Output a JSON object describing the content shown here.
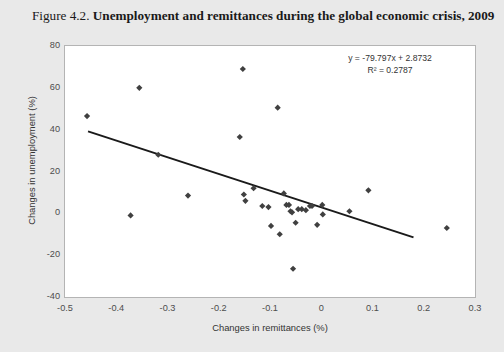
{
  "figure": {
    "number": "Figure 4.2.",
    "caption": "Unemployment and remittances during the global economic crisis, 2009"
  },
  "annotations": {
    "equation": "y = -79.797x + 2.8732",
    "r_squared": "R² = 0.2787"
  },
  "colors": {
    "background": "#e9e9e9",
    "plot_background": "#ffffff",
    "marker": "#404040",
    "trendline": "#1a1a1a",
    "frame": "#b4b4b4",
    "tick_text": "#4d4d4d"
  },
  "chart_data": {
    "type": "scatter",
    "title": "Unemployment and remittances during the global economic crisis, 2009",
    "xlabel": "Changes in remittances (%)",
    "ylabel": "Changes in unemployment (%)",
    "xlim": [
      -0.5,
      0.3
    ],
    "ylim": [
      -40,
      80
    ],
    "xticks": [
      -0.5,
      -0.4,
      -0.3,
      -0.2,
      -0.1,
      0,
      0.1,
      0.2,
      0.3
    ],
    "xtick_labels": [
      "-0.5",
      "-0.4",
      "-0.3",
      "-0.2",
      "-0.1",
      "0",
      "0.1",
      "0.2",
      "0.3"
    ],
    "yticks": [
      -40,
      -20,
      0,
      20,
      40,
      60,
      80
    ],
    "ytick_labels": [
      "-40",
      "-20",
      "0",
      "20",
      "40",
      "60",
      "80"
    ],
    "grid": false,
    "legend": null,
    "marker_shape": "diamond",
    "points": [
      [
        -0.457,
        46.5
      ],
      [
        -0.372,
        -1.0
      ],
      [
        -0.355,
        60.0
      ],
      [
        -0.318,
        28.0
      ],
      [
        -0.26,
        8.5
      ],
      [
        -0.159,
        36.5
      ],
      [
        -0.153,
        69.0
      ],
      [
        -0.151,
        9.0
      ],
      [
        -0.148,
        6.0
      ],
      [
        -0.132,
        12.0
      ],
      [
        -0.115,
        3.5
      ],
      [
        -0.103,
        3.0
      ],
      [
        -0.098,
        -6.0
      ],
      [
        -0.085,
        50.5
      ],
      [
        -0.081,
        -10.0
      ],
      [
        -0.073,
        9.5
      ],
      [
        -0.068,
        4.0
      ],
      [
        -0.063,
        4.0
      ],
      [
        -0.06,
        1.0
      ],
      [
        -0.057,
        0.5
      ],
      [
        -0.055,
        -26.5
      ],
      [
        -0.05,
        -4.5
      ],
      [
        -0.045,
        2.0
      ],
      [
        -0.038,
        2.0
      ],
      [
        -0.03,
        1.5
      ],
      [
        -0.022,
        3.5
      ],
      [
        -0.018,
        3.5
      ],
      [
        -0.008,
        -5.5
      ],
      [
        0.002,
        4.0
      ],
      [
        0.003,
        -0.5
      ],
      [
        0.055,
        1.0
      ],
      [
        0.092,
        11.0
      ],
      [
        0.245,
        -7.0
      ]
    ],
    "trendline": {
      "slope": -79.797,
      "intercept": 2.8732,
      "r_squared": 0.2787,
      "x_start": -0.455,
      "x_end": 0.18
    }
  }
}
